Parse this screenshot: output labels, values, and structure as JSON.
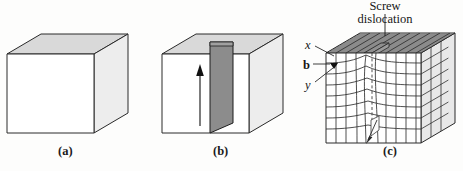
{
  "figure": {
    "background_color": "#fdfdfc",
    "line_color": "#2a2a2a",
    "panels": [
      {
        "id": "a",
        "caption": "(a)",
        "description": "perfect crystal block, no dislocation",
        "faces": {
          "front_fill": "#ffffff",
          "top_fill": "#d8d8d8",
          "right_fill": "#ececec"
        }
      },
      {
        "id": "b",
        "caption": "(b)",
        "description": "block with shear plane and shear direction arrow",
        "faces": {
          "front_fill": "#ffffff",
          "top_fill": "#d8d8d8",
          "right_fill": "#ececec",
          "shear_plane_fill": "#8c8c8c"
        },
        "arrow": {
          "name": "shear-direction-arrow",
          "direction": "up"
        }
      },
      {
        "id": "c",
        "caption": "(c)",
        "description": "screw dislocation with atomic plane grid and Burgers vector",
        "faces": {
          "front_fill": "#ffffff",
          "top_fill": "#d0d0d0",
          "right_fill": "#e6e6e6"
        },
        "labels": {
          "title_line1": "Screw",
          "title_line2": "dislocation",
          "axis_x": "x",
          "burgers_vector": "b",
          "axis_y": "y"
        }
      }
    ]
  }
}
